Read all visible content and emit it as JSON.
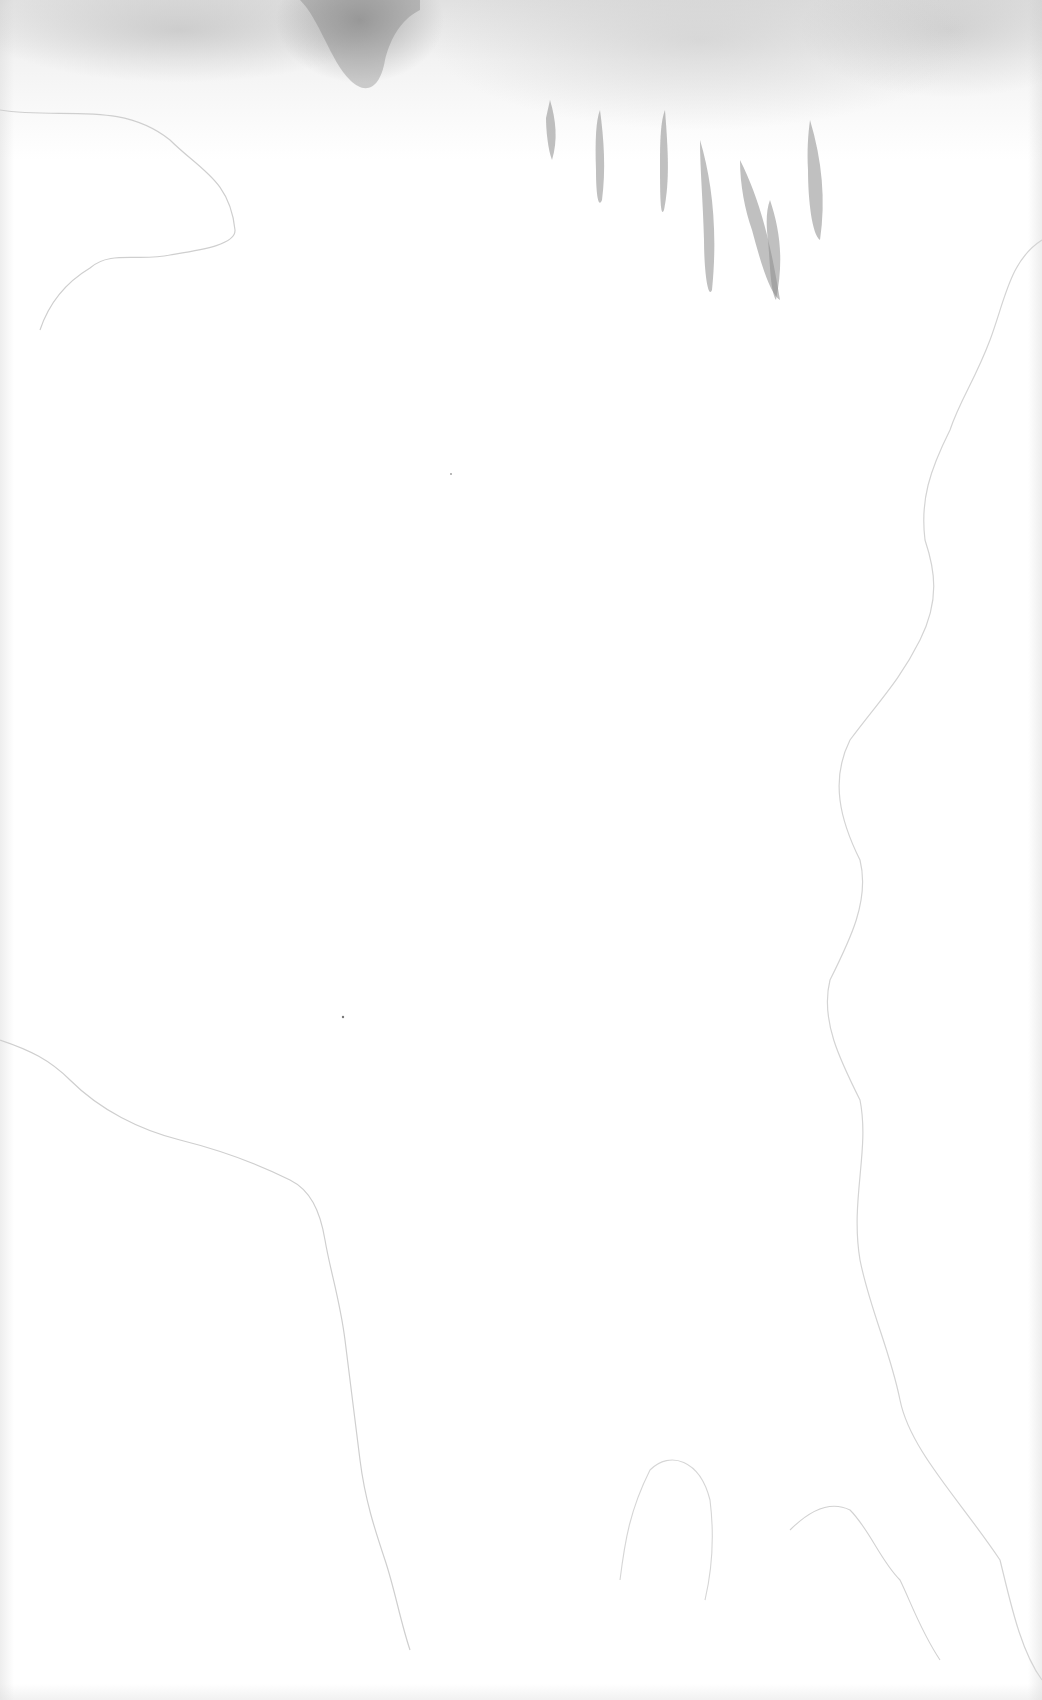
{
  "canvas": {
    "width": 1042,
    "height": 1700,
    "background": "#ffffff",
    "stain_color": "#9a9a9a",
    "stain_outline_color": "#c8c8c8"
  },
  "description": {
    "type": "blank watercolor-stained paper texture",
    "visible_text": []
  }
}
